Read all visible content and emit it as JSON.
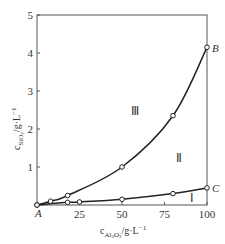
{
  "chart_data": {
    "type": "line",
    "title": "",
    "xlabel": "c_Al2O3 / g·L⁻¹",
    "ylabel": "c_SiO2 / g·L⁻¹",
    "xlim": [
      0,
      100
    ],
    "ylim": [
      0,
      5
    ],
    "grid": false,
    "legend": "none",
    "x_ticks": [
      25,
      50,
      75,
      100
    ],
    "x_tick_labels": [
      "25",
      "50",
      "75",
      "100"
    ],
    "y_ticks": [
      1,
      2,
      3,
      4,
      5
    ],
    "y_tick_labels": [
      "1",
      "2",
      "3",
      "4",
      "5"
    ],
    "series": [
      {
        "name": "AB (upper curve)",
        "x": [
          0,
          8,
          18,
          50,
          80,
          100
        ],
        "y": [
          0,
          0.1,
          0.25,
          1.0,
          2.35,
          4.15
        ],
        "marker": "open-circle"
      },
      {
        "name": "AC (lower curve)",
        "x": [
          0,
          18,
          25,
          50,
          80,
          100
        ],
        "y": [
          0,
          0.07,
          0.08,
          0.15,
          0.3,
          0.45
        ],
        "marker": "open-circle"
      }
    ],
    "annotations": [
      {
        "text": "A",
        "x": 0,
        "y": 0,
        "role": "origin point label"
      },
      {
        "text": "B",
        "x": 100,
        "y": 4.15,
        "role": "end of upper curve"
      },
      {
        "text": "C",
        "x": 100,
        "y": 0.45,
        "role": "end of lower curve"
      },
      {
        "text": "Ⅲ",
        "x": 55,
        "y": 2.55,
        "role": "region above AB"
      },
      {
        "text": "Ⅱ",
        "x": 82,
        "y": 1.15,
        "role": "region between AB and AC"
      },
      {
        "text": "Ⅰ",
        "x": 90,
        "y": 0.18,
        "role": "region below AC"
      }
    ]
  },
  "labels": {
    "x_axis_main": "c",
    "x_axis_sub": "Al",
    "x_axis_sub2": "2",
    "x_axis_sub3": "O",
    "x_axis_sub4": "3",
    "x_axis_unit": "/g·L",
    "x_axis_exp": "−1",
    "y_axis_main": "c",
    "y_axis_sub": "SiO",
    "y_axis_sub2": "2",
    "y_axis_unit": "/g·L",
    "y_axis_exp": "−1",
    "origin": "A",
    "point_b": "B",
    "point_c": "C",
    "region_3": "Ⅲ",
    "region_2": "Ⅱ",
    "region_1": "Ⅰ"
  },
  "colors": {
    "line": "#222222",
    "frame": "#555555",
    "marker_fill": "#ffffff"
  }
}
